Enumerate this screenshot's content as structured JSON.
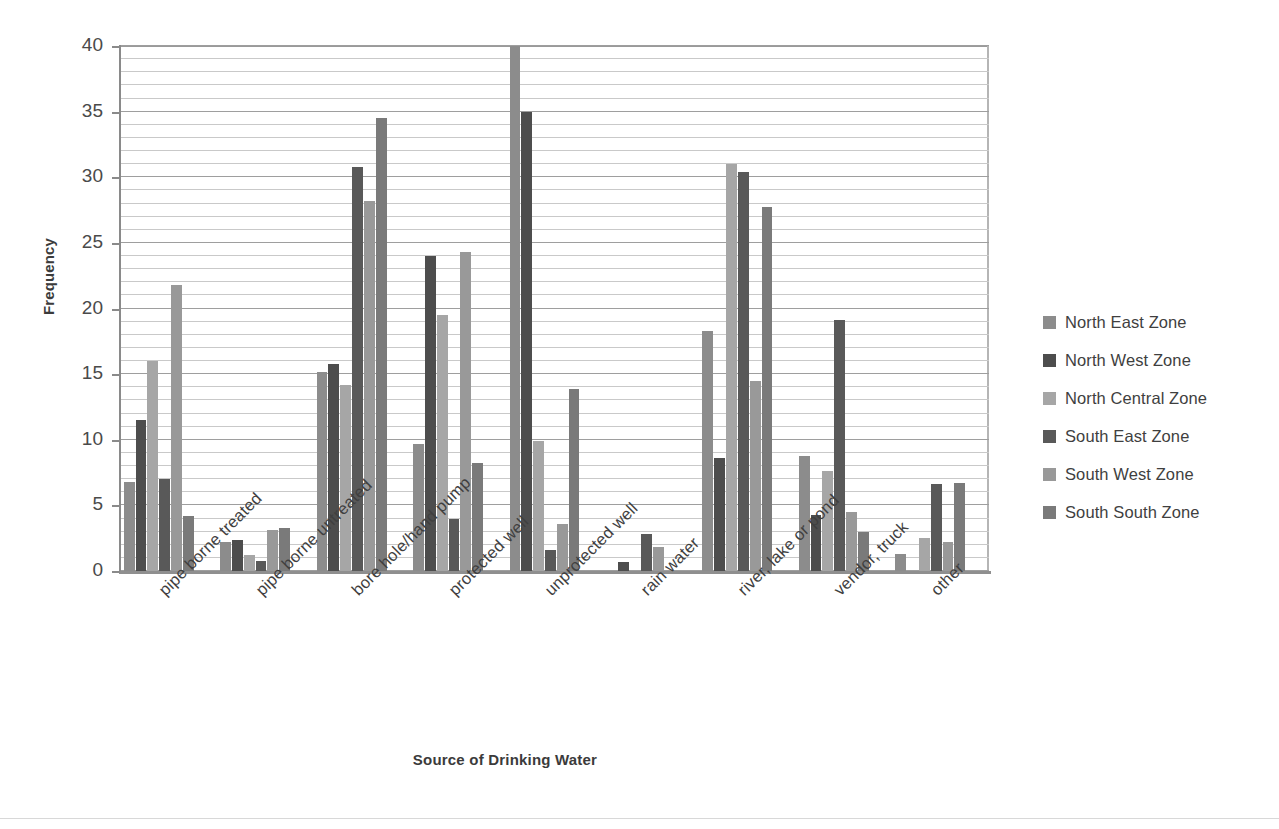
{
  "chart_data": {
    "type": "bar",
    "title": "",
    "xlabel": "Source of Drinking Water",
    "ylabel": "Frequency",
    "ylim": [
      0,
      40
    ],
    "yticks": [
      0,
      5,
      10,
      15,
      20,
      25,
      30,
      35,
      40
    ],
    "grid": true,
    "grid_minor_step": 1,
    "legend_position": "right",
    "categories": [
      "pipe borne treated",
      "pipe borne untreated",
      "bore hole/hand pump",
      "protected well",
      "unprotected well",
      "rain water",
      "river, lake or pond",
      "vendor, truck",
      "other"
    ],
    "series": [
      {
        "name": "North East Zone",
        "color": "#8c8c8c",
        "values": [
          6.8,
          2.2,
          15.2,
          9.7,
          40.0,
          0.0,
          18.3,
          8.8,
          1.3
        ]
      },
      {
        "name": "North West Zone",
        "color": "#4d4d4d",
        "values": [
          11.5,
          2.4,
          15.8,
          24.0,
          35.0,
          0.7,
          8.6,
          4.3,
          0.0
        ]
      },
      {
        "name": "North Central Zone",
        "color": "#a6a6a6",
        "values": [
          16.0,
          1.2,
          14.2,
          19.5,
          9.9,
          0.0,
          31.0,
          7.6,
          2.5
        ]
      },
      {
        "name": "South East Zone",
        "color": "#595959",
        "values": [
          7.0,
          0.8,
          30.8,
          4.0,
          1.6,
          2.8,
          30.4,
          19.1,
          6.6
        ]
      },
      {
        "name": "South West Zone",
        "color": "#999999",
        "values": [
          21.8,
          3.1,
          28.2,
          24.3,
          3.6,
          1.8,
          14.5,
          4.5,
          2.2
        ]
      },
      {
        "name": "South South Zone",
        "color": "#7a7a7a",
        "values": [
          4.2,
          3.3,
          34.5,
          8.2,
          13.9,
          0.0,
          27.7,
          3.0,
          6.7
        ]
      }
    ]
  }
}
